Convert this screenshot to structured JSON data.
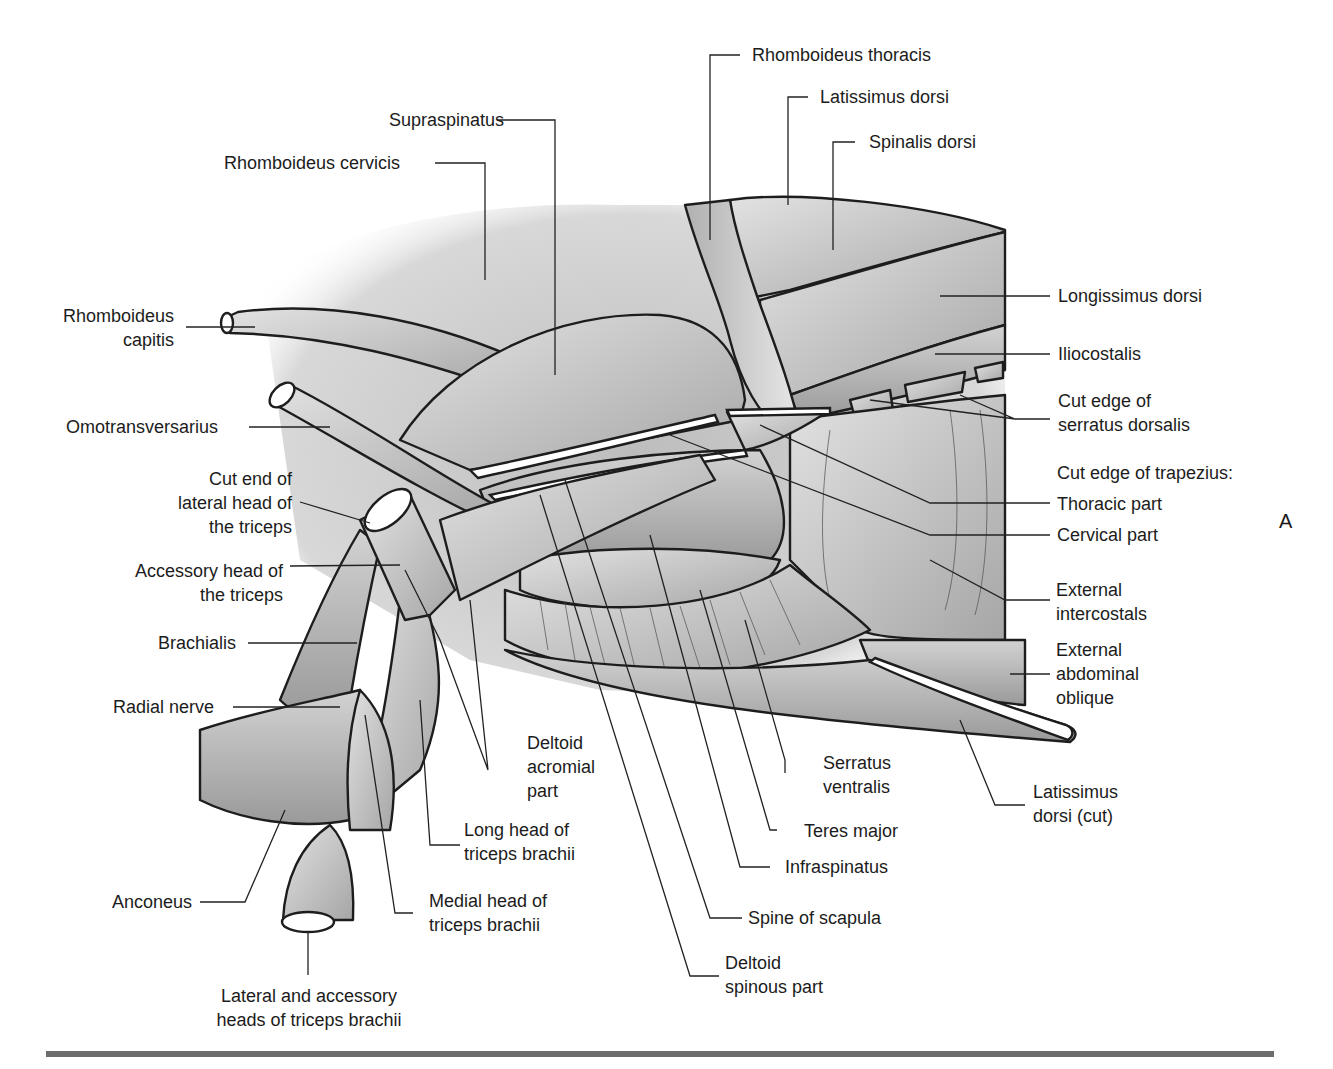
{
  "figure": {
    "panel_letter": "A",
    "labels": {
      "rhomboideus_thoracis": "Rhomboideus thoracis",
      "latissimus_dorsi": "Latissimus dorsi",
      "spinalis_dorsi": "Spinalis dorsi",
      "supraspinatus": "Supraspinatus",
      "rhomboideus_cervicis": "Rhomboideus cervicis",
      "rhomboideus_capitis_1": "Rhomboideus",
      "rhomboideus_capitis_2": "capitis",
      "longissimus_dorsi": "Longissimus dorsi",
      "iliocostalis": "Iliocostalis",
      "cut_edge_serratus_1": "Cut edge of",
      "cut_edge_serratus_2": "serratus dorsalis",
      "omotransversarius": "Omotransversarius",
      "cut_edge_trapezius": "Cut edge of trapezius:",
      "thoracic_part": "Thoracic part",
      "cervical_part": "Cervical part",
      "cut_end_lateral_1": "Cut end of",
      "cut_end_lateral_2": "lateral head of",
      "cut_end_lateral_3": "the triceps",
      "accessory_head_1": "Accessory head of",
      "accessory_head_2": "the triceps",
      "external_intercostals_1": "External",
      "external_intercostals_2": "intercostals",
      "brachialis": "Brachialis",
      "external_abdominal_oblique_1": "External",
      "external_abdominal_oblique_2": "abdominal",
      "external_abdominal_oblique_3": "oblique",
      "radial_nerve": "Radial nerve",
      "deltoid_acromial_1": "Deltoid",
      "deltoid_acromial_2": "acromial",
      "deltoid_acromial_3": "part",
      "serratus_ventralis_1": "Serratus",
      "serratus_ventralis_2": "ventralis",
      "latissimus_cut_1": "Latissimus",
      "latissimus_cut_2": "dorsi (cut)",
      "long_head_1": "Long head of",
      "long_head_2": "triceps brachii",
      "teres_major": "Teres major",
      "infraspinatus": "Infraspinatus",
      "medial_head_1": "Medial head of",
      "medial_head_2": "triceps brachii",
      "anconeus": "Anconeus",
      "spine_of_scapula": "Spine of scapula",
      "deltoid_spinous_1": "Deltoid",
      "deltoid_spinous_2": "spinous part",
      "lateral_accessory_1": "Lateral and accessory",
      "lateral_accessory_2": "heads of triceps brachii"
    }
  }
}
